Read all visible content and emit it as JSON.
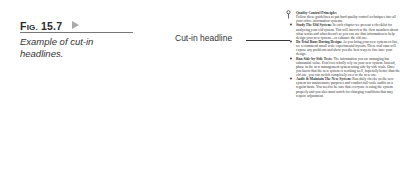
{
  "figure": {
    "label_prefix_big": "F",
    "label_prefix_small": "IG.",
    "label_number": "15.7",
    "caption": "Example of cut-in headlines."
  },
  "annotation": {
    "label": "Cut-in headline"
  },
  "document": {
    "pin_icon": "pushpin-icon",
    "title": "Quality Control Principles",
    "intro": "Follow these guidelines to put hard quality control techniques into all your office information systems.",
    "items": [
      {
        "head": "Study The Old System:",
        "body": "In each chapter we present a checklist for analyzing your old system. You will interview the flow members about what works and what doesn't so you can use that information to help design your new system—or enhance the old one."
      },
      {
        "head": "Do Trial Runs During Design:",
        "body": "As you bring your new system on line, we recommend small scale experimental tryouts. These trial runs will expose any problems and show you the best ways to fine tune your design."
      },
      {
        "head": "Run Side-by-Side Tests:",
        "body": "The information you are managing has substantial value. Don't too wholly rely on your new system. Instead, phase in the new management system using side-by-side trials. Once you know that the new system is working well, hopefully better than the old one, you can switch completely over to the new one."
      },
      {
        "head": "Audit & Maintain The New System:",
        "body": "Run daily checks on the new system for maintenance purposes and conduct full-scale audits on a regular basis. You need to be sure that everyone is using the system properly and you also must watch for changing conditions that may require adjustment."
      }
    ]
  }
}
